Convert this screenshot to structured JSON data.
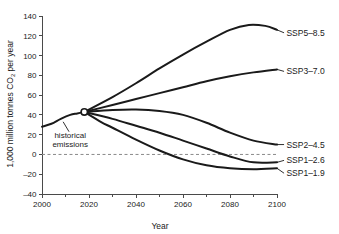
{
  "chart_data": {
    "type": "line",
    "title": "",
    "xlabel": "Year",
    "ylabel": "1,000 million tonnes CO2 per year",
    "ylabel_parts": {
      "before": "1,000 million tonnes CO",
      "subscript": "2",
      "after": " per year"
    },
    "xlim": [
      2000,
      2100
    ],
    "ylim": [
      -40,
      140
    ],
    "xticks": [
      2000,
      2020,
      2040,
      2060,
      2080,
      2100
    ],
    "xtick_labels": [
      "2000",
      "2020",
      "2040",
      "2060",
      "2080",
      "2100"
    ],
    "xminor_step": 10,
    "yticks": [
      -40,
      -20,
      0,
      20,
      40,
      60,
      80,
      100,
      120,
      140
    ],
    "ytick_labels": [
      "-40",
      "-20",
      "0",
      "20",
      "40",
      "60",
      "80",
      "100",
      "120",
      "140"
    ],
    "grid": false,
    "legend_position": "right-inline",
    "zero_reference_line": 0,
    "branch_point": {
      "x": 2018,
      "y": 43
    },
    "annotations": [
      {
        "name": "historical-emissions",
        "lines": [
          "historical",
          "emissions"
        ],
        "text_x": 2012,
        "text_y": 17,
        "leader_from": {
          "x": 2009,
          "y": 33
        },
        "leader_to": {
          "x": 2011.5,
          "y": 23
        }
      }
    ],
    "historical": {
      "name": "historical emissions",
      "x": [
        2000,
        2004,
        2008,
        2012,
        2015,
        2018
      ],
      "values": [
        28,
        31,
        36,
        40,
        41.5,
        43
      ]
    },
    "series": [
      {
        "name": "SSP5-8.5",
        "label": "SSP5–8.5",
        "label_x": 2104,
        "label_y": 123,
        "x": [
          2018,
          2030,
          2040,
          2050,
          2060,
          2070,
          2080,
          2088,
          2095,
          2100
        ],
        "values": [
          43,
          58,
          72,
          87,
          101,
          114,
          126,
          131,
          130,
          126
        ]
      },
      {
        "name": "SSP3-7.0",
        "label": "SSP3–7.0",
        "label_x": 2104,
        "label_y": 84,
        "x": [
          2018,
          2030,
          2040,
          2050,
          2060,
          2070,
          2080,
          2090,
          2100
        ],
        "values": [
          43,
          50,
          56,
          62,
          68,
          74,
          79,
          83,
          86
        ]
      },
      {
        "name": "SSP2-4.5",
        "label": "SSP2–4.5",
        "label_x": 2104,
        "label_y": 10,
        "x": [
          2018,
          2030,
          2040,
          2050,
          2060,
          2070,
          2080,
          2090,
          2100
        ],
        "values": [
          43,
          45,
          45.5,
          44,
          40,
          32,
          22,
          14,
          10
        ]
      },
      {
        "name": "SSP1-2.6",
        "label": "SSP1–2.6",
        "label_x": 2104,
        "label_y": -6,
        "x": [
          2018,
          2030,
          2040,
          2050,
          2060,
          2070,
          2080,
          2090,
          2100
        ],
        "values": [
          43,
          36,
          29,
          22,
          14,
          6,
          -2,
          -8,
          -8
        ]
      },
      {
        "name": "SSP1-1.9",
        "label": "SSP1–1.9",
        "label_x": 2104,
        "label_y": -19,
        "x": [
          2018,
          2025,
          2030,
          2040,
          2050,
          2060,
          2070,
          2080,
          2090,
          2100
        ],
        "values": [
          43,
          33,
          27,
          15,
          4,
          -5,
          -11,
          -14,
          -15,
          -14
        ]
      }
    ],
    "label_leaders": [
      {
        "name": "SSP5-8.5",
        "from": {
          "x": 2100,
          "y": 126
        },
        "to": {
          "x": 2103,
          "y": 123
        }
      },
      {
        "name": "SSP3-7.0",
        "from": {
          "x": 2100,
          "y": 86
        },
        "to": {
          "x": 2103,
          "y": 84
        }
      },
      {
        "name": "SSP2-4.5",
        "from": {
          "x": 2100,
          "y": 10
        },
        "to": {
          "x": 2103,
          "y": 10
        }
      },
      {
        "name": "SSP1-2.6",
        "from": {
          "x": 2100,
          "y": -8
        },
        "to": {
          "x": 2103,
          "y": -6
        }
      },
      {
        "name": "SSP1-1.9",
        "from": {
          "x": 2100,
          "y": -14
        },
        "to": {
          "x": 2103,
          "y": -19
        }
      }
    ]
  }
}
